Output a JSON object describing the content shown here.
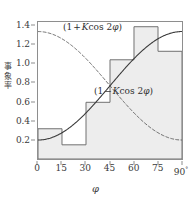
{
  "chart_data": {
    "type": "bar",
    "title": "",
    "subtitle": "",
    "xlabel": "φ",
    "ylabel": "事象率",
    "ylabel_chars": [
      "事",
      "象",
      "率"
    ],
    "xlim": [
      0,
      90
    ],
    "ylim": [
      0.0,
      1.45
    ],
    "grid": false,
    "legend": "none",
    "bin_width": 15,
    "categories": [
      "0–15",
      "15–30",
      "30–45",
      "45–60",
      "60–75",
      "75–90"
    ],
    "bin_edges": [
      0,
      15,
      30,
      45,
      60,
      75,
      90
    ],
    "values": [
      0.32,
      0.15,
      0.6,
      1.05,
      1.4,
      1.14
    ],
    "series": [
      {
        "name": "(1 − K cos 2φ)",
        "style": "solid",
        "annotation": "(1 − K cos 2φ)",
        "x": [
          0,
          7.5,
          15,
          22.5,
          30,
          37.5,
          45,
          52.5,
          60,
          67.5,
          75,
          82.5,
          90
        ],
        "values": [
          0.2,
          0.22,
          0.28,
          0.38,
          0.5,
          0.63,
          0.775,
          0.92,
          1.05,
          1.17,
          1.27,
          1.33,
          1.35
        ]
      },
      {
        "name": "(1 + K cos 2φ)",
        "style": "dashed",
        "annotation": "(1 + K cos 2φ)",
        "x": [
          0,
          7.5,
          15,
          22.5,
          30,
          37.5,
          45,
          52.5,
          60,
          67.5,
          75,
          82.5,
          90
        ],
        "values": [
          1.35,
          1.33,
          1.27,
          1.17,
          1.05,
          0.92,
          0.775,
          0.63,
          0.5,
          0.38,
          0.28,
          0.22,
          0.2
        ]
      }
    ],
    "xticks": [
      0,
      15,
      30,
      45,
      60,
      75,
      90
    ],
    "xtick_labels": [
      "0",
      "15",
      "30",
      "45",
      "60",
      "75",
      "90"
    ],
    "xtick_last_suffix": "°",
    "yticks": [
      0.2,
      0.4,
      0.6,
      0.8,
      1.0,
      1.2,
      1.4
    ],
    "ytick_labels": [
      "0.2",
      "0.4",
      "0.6",
      "0.8",
      "1.0",
      "1.2",
      "1.4"
    ],
    "colors": {
      "frame": "#8e8e8e",
      "histogram_line": "#6f6f6f",
      "histogram_fill": "#ededed",
      "curve_solid": "#3a3a3a",
      "curve_dashed": "#5a5a5a",
      "text": "#3a3a3a",
      "background": "#ffffff"
    }
  },
  "annotations": {
    "upper": {
      "open": "(1",
      "operator": "+",
      "coef": "K",
      "func": "cos 2",
      "var": "φ",
      "close": ")"
    },
    "lower": {
      "open": "(1",
      "operator": "−",
      "coef": "K",
      "func": "cos 2",
      "var": "φ",
      "close": ")"
    }
  },
  "axes": {
    "x_title": "φ",
    "y_title_chars": [
      "事",
      "象",
      "率"
    ],
    "x_labels": [
      "0",
      "15",
      "30",
      "45",
      "60",
      "75",
      "90"
    ],
    "x_degree_suffix": "°",
    "y_labels": [
      "1.4",
      "1.2",
      "1.0",
      "0.8",
      "0.6",
      "0.4",
      "0.2"
    ]
  }
}
